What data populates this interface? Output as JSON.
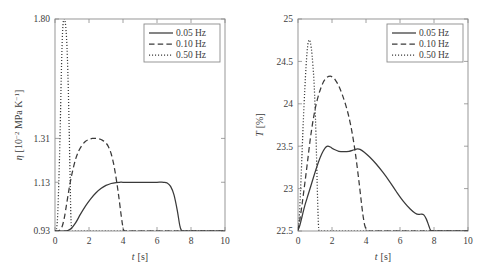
{
  "figure": {
    "background": "#ffffff",
    "curve_color": "#3a3a3a",
    "axis_color": "#8c8c8c",
    "panel_count": 2
  },
  "chart_data": [
    {
      "panel": "left",
      "type": "line",
      "title": "",
      "xlabel": "t [s]",
      "xlabel_symbol": "t",
      "xlabel_unit": "[s]",
      "ylabel": "η [10−2 MPa K−1]",
      "ylabel_symbol": "η",
      "ylabel_unit": "[10−2 MPa K−1]",
      "xlim": [
        0,
        10
      ],
      "ylim": [
        0.93,
        1.8
      ],
      "grid": false,
      "xticks": [
        0,
        2,
        4,
        6,
        8,
        10
      ],
      "xticklabels": [
        "0",
        "2",
        "4",
        "6",
        "8",
        "10"
      ],
      "yticks": [
        0.93,
        1.13,
        1.31,
        1.8
      ],
      "yticklabels": [
        "0.93",
        "1.13",
        "1.31",
        "1.80"
      ],
      "legend_position": "upper right",
      "series": [
        {
          "name": "0.05 Hz",
          "style": "solid",
          "x": [
            0.0,
            0.25,
            0.5,
            0.75,
            0.95,
            1.2,
            1.5,
            1.8,
            2.1,
            2.4,
            2.7,
            3.0,
            3.3,
            3.6,
            3.8,
            4.0,
            4.4,
            5.0,
            5.6,
            6.0,
            6.4,
            6.6,
            6.8,
            7.0,
            7.2,
            7.35,
            7.5,
            8.0,
            9.0,
            10.0
          ],
          "y": [
            0.93,
            0.93,
            0.93,
            0.932,
            0.94,
            0.962,
            0.999,
            1.033,
            1.062,
            1.086,
            1.104,
            1.117,
            1.125,
            1.129,
            1.13,
            1.13,
            1.13,
            1.13,
            1.13,
            1.13,
            1.13,
            1.127,
            1.113,
            1.078,
            1.012,
            0.95,
            0.93,
            0.93,
            0.93,
            0.93
          ]
        },
        {
          "name": "0.10 Hz",
          "style": "dashed",
          "x": [
            0.0,
            0.2,
            0.4,
            0.55,
            0.7,
            0.85,
            1.0,
            1.2,
            1.4,
            1.6,
            1.8,
            2.0,
            2.2,
            2.4,
            2.6,
            2.8,
            3.0,
            3.15,
            3.3,
            3.45,
            3.6,
            3.75,
            3.9,
            4.0,
            4.1,
            4.5,
            6.0,
            8.0,
            10.0
          ],
          "y": [
            0.93,
            0.93,
            0.945,
            0.985,
            1.048,
            1.112,
            1.165,
            1.222,
            1.259,
            1.283,
            1.298,
            1.306,
            1.31,
            1.31,
            1.308,
            1.302,
            1.291,
            1.275,
            1.248,
            1.205,
            1.145,
            1.072,
            0.99,
            0.945,
            0.93,
            0.93,
            0.93,
            0.93,
            0.93
          ]
        },
        {
          "name": "0.50 Hz",
          "style": "dotted",
          "x": [
            0.0,
            0.08,
            0.15,
            0.22,
            0.3,
            0.37,
            0.43,
            0.48,
            0.53,
            0.58,
            0.63,
            0.68,
            0.73,
            0.78,
            0.83,
            0.88,
            0.93,
            0.97,
            1.0,
            1.1,
            1.5,
            3.0,
            6.0,
            10.0
          ],
          "y": [
            0.93,
            0.935,
            0.985,
            1.12,
            1.33,
            1.57,
            1.72,
            1.785,
            1.8,
            1.795,
            1.77,
            1.72,
            1.64,
            1.52,
            1.36,
            1.18,
            1.0,
            0.945,
            0.93,
            0.93,
            0.93,
            0.93,
            0.93,
            0.93
          ]
        }
      ]
    },
    {
      "panel": "right",
      "type": "line",
      "title": "",
      "xlabel": "t [s]",
      "xlabel_symbol": "t",
      "xlabel_unit": "[s]",
      "ylabel": "T [%]",
      "ylabel_symbol": "T",
      "ylabel_unit": "[%]",
      "xlim": [
        0,
        10
      ],
      "ylim": [
        22.5,
        25
      ],
      "grid": false,
      "xticks": [
        0,
        2,
        4,
        6,
        8,
        10
      ],
      "xticklabels": [
        "0",
        "2",
        "4",
        "6",
        "8",
        "10"
      ],
      "yticks": [
        22.5,
        23,
        23.5,
        24,
        24.5,
        25
      ],
      "yticklabels": [
        "22.5",
        "23",
        "23.5",
        "24",
        "24.5",
        "25"
      ],
      "legend_position": "upper right",
      "series": [
        {
          "name": "0.05 Hz",
          "style": "solid",
          "x": [
            0.0,
            0.1,
            0.25,
            0.4,
            0.6,
            0.8,
            1.0,
            1.2,
            1.4,
            1.6,
            1.75,
            1.9,
            2.1,
            2.4,
            2.7,
            3.0,
            3.3,
            3.5,
            3.65,
            3.9,
            4.2,
            4.6,
            5.0,
            5.4,
            5.8,
            6.2,
            6.6,
            6.9,
            7.1,
            7.25,
            7.4,
            7.55,
            7.7,
            7.8,
            8.0,
            9.0,
            10.0
          ],
          "y": [
            22.51,
            22.56,
            22.68,
            22.8,
            22.93,
            23.06,
            23.19,
            23.31,
            23.41,
            23.48,
            23.5,
            23.49,
            23.465,
            23.44,
            23.435,
            23.44,
            23.458,
            23.468,
            23.462,
            23.43,
            23.375,
            23.29,
            23.19,
            23.08,
            22.96,
            22.85,
            22.76,
            22.71,
            22.695,
            22.7,
            22.69,
            22.64,
            22.56,
            22.51,
            22.5,
            22.5,
            22.5
          ]
        },
        {
          "name": "0.10 Hz",
          "style": "dashed",
          "x": [
            0.0,
            0.1,
            0.25,
            0.4,
            0.55,
            0.7,
            0.85,
            1.0,
            1.15,
            1.3,
            1.5,
            1.7,
            1.9,
            2.05,
            2.2,
            2.4,
            2.6,
            2.8,
            3.0,
            3.2,
            3.4,
            3.6,
            3.75,
            3.85,
            3.95,
            4.1,
            4.5,
            6.0,
            8.0,
            10.0
          ],
          "y": [
            22.51,
            22.62,
            22.83,
            23.06,
            23.3,
            23.55,
            23.76,
            23.93,
            24.06,
            24.16,
            24.26,
            24.31,
            24.325,
            24.31,
            24.28,
            24.21,
            24.11,
            23.99,
            23.84,
            23.64,
            23.38,
            23.06,
            22.8,
            22.65,
            22.55,
            22.5,
            22.5,
            22.5,
            22.5,
            22.5
          ]
        },
        {
          "name": "0.50 Hz",
          "style": "dotted",
          "x": [
            0.0,
            0.06,
            0.12,
            0.18,
            0.25,
            0.32,
            0.4,
            0.47,
            0.53,
            0.58,
            0.63,
            0.68,
            0.73,
            0.78,
            0.83,
            0.88,
            0.93,
            0.98,
            1.03,
            1.08,
            1.13,
            1.18,
            1.22,
            1.3,
            1.6,
            3.0,
            6.0,
            10.0
          ],
          "y": [
            22.51,
            22.62,
            22.84,
            23.12,
            23.48,
            23.83,
            24.17,
            24.43,
            24.6,
            24.7,
            24.745,
            24.75,
            24.72,
            24.66,
            24.57,
            24.45,
            24.3,
            24.1,
            23.82,
            23.46,
            23.05,
            22.7,
            22.53,
            22.5,
            22.5,
            22.5,
            22.5,
            22.5
          ]
        }
      ]
    }
  ],
  "legend": {
    "entries": [
      {
        "label": "0.05 Hz",
        "style": "solid"
      },
      {
        "label": "0.10 Hz",
        "style": "dashed"
      },
      {
        "label": "0.50 Hz",
        "style": "dotted"
      }
    ]
  }
}
